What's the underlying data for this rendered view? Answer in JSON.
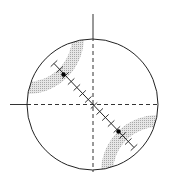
{
  "diagram": {
    "type": "stereonet-projection",
    "canvas": {
      "width": 170,
      "height": 184,
      "background": "#ffffff"
    },
    "primitive_circle": {
      "cx": 92.5,
      "cy": 104.5,
      "r": 65.5,
      "stroke": "#222222",
      "stroke_width": 1
    },
    "axes": {
      "vertical": {
        "x": 93,
        "y_top": 14,
        "y_solid_end": 37,
        "y_bottom": 172
      },
      "horizontal": {
        "y": 104.5,
        "x_left": 10,
        "x_solid_end": 27,
        "x_right": 157
      },
      "stroke": "#333333",
      "dash": "4,3"
    },
    "bands": [
      {
        "name": "upper-left-band",
        "cx": 27,
        "cy": 37,
        "r_inner": 45,
        "r_outer": 57,
        "fill": "#c8c8c8"
      },
      {
        "name": "lower-right-band",
        "cx": 158,
        "cy": 172,
        "r_inner": 45,
        "r_outer": 57,
        "fill": "#c8c8c8"
      }
    ],
    "scale_line": {
      "x1": 54,
      "y1": 63.5,
      "x2": 134,
      "y2": 147.5,
      "tick_count": 14,
      "tick_half_length": 4.5,
      "stroke": "#222222"
    },
    "points": [
      {
        "name": "upper-point",
        "x": 63.5,
        "y": 74.5,
        "r": 2.2
      },
      {
        "name": "lower-point",
        "x": 118.5,
        "y": 131.5,
        "r": 2.2
      }
    ]
  }
}
